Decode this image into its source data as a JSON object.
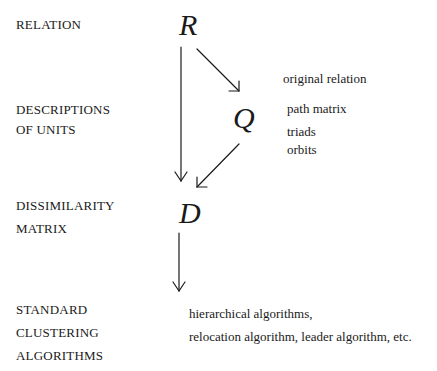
{
  "left_labels": {
    "relation": "RELATION",
    "descriptions_1": "DESCRIPTIONS",
    "descriptions_2": "OF UNITS",
    "dissimilarity_1": "DISSIMILARITY",
    "dissimilarity_2": "MATRIX",
    "standard_1": "STANDARD",
    "standard_2": "CLUSTERING",
    "standard_3": "ALGORITHMS"
  },
  "nodes": {
    "r": "R",
    "q": "Q",
    "d": "D"
  },
  "q_descriptions": [
    "original relation",
    "path matrix",
    "triads",
    "orbits"
  ],
  "algorithms": [
    "hierarchical algorithms,",
    "relocation algorithm, leader algorithm, etc."
  ],
  "edges": [
    {
      "from": "R",
      "to": "Q"
    },
    {
      "from": "R",
      "to": "D"
    },
    {
      "from": "Q",
      "to": "D"
    },
    {
      "from": "D",
      "to": "STANDARD CLUSTERING ALGORITHMS"
    }
  ]
}
